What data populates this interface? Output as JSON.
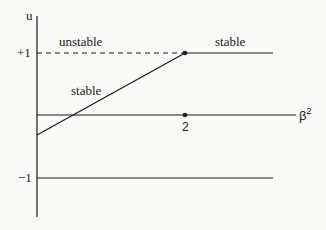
{
  "axes": {
    "y_label": "u",
    "x_label_base": "β",
    "x_label_exp": "2",
    "y_ticks": [
      "+1",
      "−1"
    ],
    "x_ticks": [
      "2"
    ]
  },
  "regions": {
    "upper_left": "unstable",
    "upper_right": "stable",
    "slanted": "stable"
  },
  "colors": {
    "line": "#1a1a1a",
    "background": "#f9f9f7"
  },
  "geometry": {
    "axis_x": 37,
    "y_plus1": 53,
    "y_zero": 115,
    "y_minus1": 178,
    "x_two": 185,
    "slant_start_y": 135
  }
}
